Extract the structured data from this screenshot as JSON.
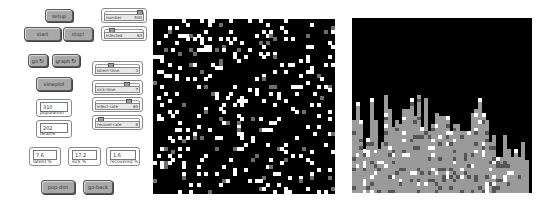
{
  "buttons": {
    "setup": "setup",
    "start": "start",
    "stop": "stop!",
    "go": "go",
    "graph": "graph",
    "viewplot": "viewplot",
    "popdist": "pop-dist",
    "goback": "go-back",
    "forever_icon": "↻"
  },
  "sliders": {
    "number": {
      "label": "number",
      "value": "500",
      "pos": 0.93
    },
    "infected": {
      "label": "infected",
      "value": "63",
      "pos": 0.12
    },
    "latent_time": {
      "label": "latent-time",
      "value": "3",
      "pos": 0.32
    },
    "sick_time": {
      "label": "sick-time",
      "value": "7",
      "pos": 0.72
    },
    "infect_rate": {
      "label": "infect-rate",
      "value": "60",
      "pos": 0.78
    },
    "recover_rate": {
      "label": "recover-rate",
      "value": "8",
      "pos": 0.04
    }
  },
  "monitors": {
    "population": {
      "label": "population",
      "value": "310"
    },
    "deaths": {
      "label": "deaths",
      "value": "202"
    },
    "latent_pct": {
      "label": "latent %",
      "value": "7.6"
    },
    "sick_pct": {
      "label": "sick %",
      "value": "17.2"
    },
    "recovered_pct": {
      "label": "recovered %",
      "value": "1.6"
    }
  },
  "world_view": {
    "cols": 50,
    "rows": 48,
    "seed": 7,
    "white_density": 0.11,
    "gray_density": 0.025,
    "colors": {
      "background": "#000000",
      "healthy": "#ffffff",
      "sick": "#6e6e6e"
    }
  },
  "plot_view": {
    "cols": 50,
    "rows": 48,
    "column_heights": [
      20,
      25,
      20,
      12,
      15,
      26,
      20,
      12,
      14,
      27,
      23,
      18,
      20,
      19,
      23,
      23,
      26,
      21,
      27,
      18,
      26,
      17,
      19,
      22,
      21,
      21,
      21,
      17,
      19,
      19,
      17,
      17,
      17,
      22,
      23,
      26,
      22,
      20,
      14,
      16,
      10,
      10,
      16,
      12,
      10,
      12,
      10,
      14,
      9,
      0
    ],
    "colors": {
      "background": "#000000",
      "bar": "#9a9a9a",
      "dark": "#555555",
      "light": "#ffffff"
    }
  }
}
